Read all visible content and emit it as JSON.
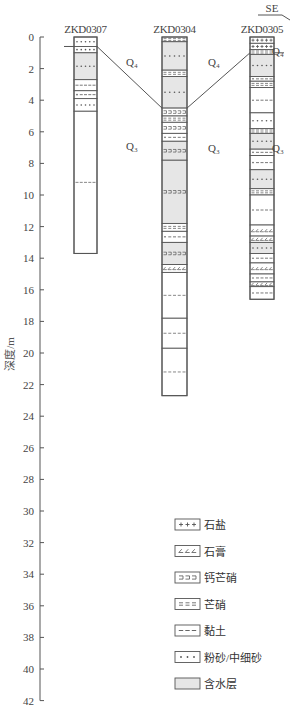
{
  "axis": {
    "title": "深度/m",
    "ticks": [
      0,
      2,
      4,
      6,
      8,
      10,
      12,
      14,
      16,
      18,
      20,
      22,
      24,
      26,
      28,
      30,
      32,
      34,
      36,
      38,
      40,
      42
    ],
    "min": 0,
    "max": 42
  },
  "direction_label": "SE",
  "wells": [
    {
      "name": "ZKD0307",
      "depth": 13.7,
      "layers": [
        {
          "top": 0,
          "bottom": 0.6,
          "pattern": "sand",
          "aquifer": false
        },
        {
          "top": 0.6,
          "bottom": 1.0,
          "pattern": "sand",
          "aquifer": false
        },
        {
          "top": 1.0,
          "bottom": 2.7,
          "pattern": "sand",
          "aquifer": true
        },
        {
          "top": 2.7,
          "bottom": 3.4,
          "pattern": "clay",
          "aquifer": false
        },
        {
          "top": 3.4,
          "bottom": 3.9,
          "pattern": "clay_sand",
          "aquifer": false
        },
        {
          "top": 3.9,
          "bottom": 4.7,
          "pattern": "sand",
          "aquifer": false
        },
        {
          "top": 4.7,
          "bottom": 13.7,
          "pattern": "clay_sparse",
          "aquifer": false
        }
      ]
    },
    {
      "name": "ZKD0304",
      "depth": 22.7,
      "layers": [
        {
          "top": 0,
          "bottom": 0.3,
          "pattern": "mirabilite",
          "aquifer": false
        },
        {
          "top": 0.3,
          "bottom": 2.1,
          "pattern": "sand",
          "aquifer": true
        },
        {
          "top": 2.1,
          "bottom": 2.5,
          "pattern": "mirabilite",
          "aquifer": false
        },
        {
          "top": 2.5,
          "bottom": 4.5,
          "pattern": "sand",
          "aquifer": true
        },
        {
          "top": 4.5,
          "bottom": 5.0,
          "pattern": "glauberite",
          "aquifer": false
        },
        {
          "top": 5.0,
          "bottom": 5.4,
          "pattern": "mirabilite",
          "aquifer": false
        },
        {
          "top": 5.4,
          "bottom": 6.1,
          "pattern": "glauberite",
          "aquifer": false
        },
        {
          "top": 6.1,
          "bottom": 6.6,
          "pattern": "clay_sand",
          "aquifer": false
        },
        {
          "top": 6.6,
          "bottom": 7.8,
          "pattern": "glauberite",
          "aquifer": true
        },
        {
          "top": 7.8,
          "bottom": 11.8,
          "pattern": "glauberite",
          "aquifer": true
        },
        {
          "top": 11.8,
          "bottom": 12.3,
          "pattern": "mirabilite",
          "aquifer": false
        },
        {
          "top": 12.3,
          "bottom": 13.0,
          "pattern": "clay_sand",
          "aquifer": false
        },
        {
          "top": 13.0,
          "bottom": 14.4,
          "pattern": "glauberite",
          "aquifer": true
        },
        {
          "top": 14.4,
          "bottom": 14.9,
          "pattern": "gypsum",
          "aquifer": false
        },
        {
          "top": 14.9,
          "bottom": 17.8,
          "pattern": "clay_sparse",
          "aquifer": false
        },
        {
          "top": 17.8,
          "bottom": 19.7,
          "pattern": "clay_sparse",
          "aquifer": false
        },
        {
          "top": 19.7,
          "bottom": 22.7,
          "pattern": "clay_sparse",
          "aquifer": false
        }
      ]
    },
    {
      "name": "ZKD0305",
      "depth": 16.6,
      "layers": [
        {
          "top": 0,
          "bottom": 0.4,
          "pattern": "salt",
          "aquifer": false
        },
        {
          "top": 0.4,
          "bottom": 0.8,
          "pattern": "salt",
          "aquifer": false
        },
        {
          "top": 0.8,
          "bottom": 1.1,
          "pattern": "mirabilite",
          "aquifer": false
        },
        {
          "top": 1.1,
          "bottom": 2.5,
          "pattern": "sand",
          "aquifer": true
        },
        {
          "top": 2.5,
          "bottom": 2.8,
          "pattern": "clay_sand",
          "aquifer": false
        },
        {
          "top": 2.8,
          "bottom": 3.2,
          "pattern": "mirabilite",
          "aquifer": false
        },
        {
          "top": 3.2,
          "bottom": 4.8,
          "pattern": "clay_sand",
          "aquifer": false
        },
        {
          "top": 4.8,
          "bottom": 5.8,
          "pattern": "sand",
          "aquifer": false
        },
        {
          "top": 5.8,
          "bottom": 6.1,
          "pattern": "mirabilite",
          "aquifer": false
        },
        {
          "top": 6.1,
          "bottom": 7.1,
          "pattern": "sand",
          "aquifer": true
        },
        {
          "top": 7.1,
          "bottom": 7.5,
          "pattern": "clay_sand",
          "aquifer": false
        },
        {
          "top": 7.5,
          "bottom": 8.4,
          "pattern": "clay_sand",
          "aquifer": false
        },
        {
          "top": 8.4,
          "bottom": 9.6,
          "pattern": "sand",
          "aquifer": true
        },
        {
          "top": 9.6,
          "bottom": 10.0,
          "pattern": "mirabilite",
          "aquifer": false
        },
        {
          "top": 10.0,
          "bottom": 11.9,
          "pattern": "clay_sand",
          "aquifer": false
        },
        {
          "top": 11.9,
          "bottom": 12.6,
          "pattern": "gypsum",
          "aquifer": false
        },
        {
          "top": 12.6,
          "bottom": 13.0,
          "pattern": "gypsum",
          "aquifer": false
        },
        {
          "top": 13.0,
          "bottom": 13.7,
          "pattern": "sand",
          "aquifer": true
        },
        {
          "top": 13.7,
          "bottom": 14.3,
          "pattern": "clay_sand",
          "aquifer": false
        },
        {
          "top": 14.3,
          "bottom": 15.0,
          "pattern": "gypsum",
          "aquifer": false
        },
        {
          "top": 15.0,
          "bottom": 15.5,
          "pattern": "clay_sand",
          "aquifer": false
        },
        {
          "top": 15.5,
          "bottom": 15.8,
          "pattern": "gypsum",
          "aquifer": false
        },
        {
          "top": 15.8,
          "bottom": 16.6,
          "pattern": "clay_sand",
          "aquifer": false
        }
      ]
    }
  ],
  "strata_labels": [
    {
      "text": "Q₄",
      "x": 132,
      "depth": 1.6
    },
    {
      "text": "Q₄",
      "x": 214,
      "depth": 1.6
    },
    {
      "text": "Q₄",
      "x": 278,
      "depth": 0.9
    },
    {
      "text": "Q₃",
      "x": 132,
      "depth": 6.9
    },
    {
      "text": "Q₃",
      "x": 214,
      "depth": 7.0
    },
    {
      "text": "Q₃",
      "x": 278,
      "depth": 7.0
    }
  ],
  "legend": [
    {
      "pattern": "salt",
      "label": "石盐"
    },
    {
      "pattern": "gypsum",
      "label": "石膏"
    },
    {
      "pattern": "glauberite",
      "label": "钙芒硝"
    },
    {
      "pattern": "mirabilite",
      "label": "芒硝"
    },
    {
      "pattern": "clay",
      "label": "黏土"
    },
    {
      "pattern": "sand",
      "label": "粉砂/中细砂"
    },
    {
      "pattern": "aquifer",
      "label": "含水层"
    }
  ],
  "colors": {
    "line": "#555555",
    "aquifer_fill": "#e6e6e6",
    "text": "#444444"
  }
}
